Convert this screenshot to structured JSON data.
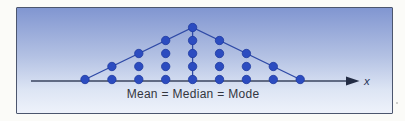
{
  "figure": {
    "caption": "Mean = Median = Mode",
    "axis_label": "x"
  },
  "chart_data": {
    "type": "scatter",
    "subtype": "dot-plot",
    "title": "",
    "x": [
      1,
      2,
      3,
      4,
      5,
      6,
      7,
      8,
      9
    ],
    "frequencies": [
      1,
      2,
      3,
      4,
      5,
      4,
      3,
      2,
      1
    ],
    "xlabel": "x",
    "ylabel": "",
    "annotation": "Mean = Median = Mode",
    "symmetric": true,
    "grid": false,
    "legend": false,
    "connectors": [
      "left-tail-to-peak",
      "peak-to-right-tail",
      "vertical-peak-to-axis"
    ]
  },
  "colors": {
    "dot_fill": "#2c4cc0",
    "dot_edge": "#1e3aa0",
    "connector_line": "#2f4aa6",
    "axis_line": "#3a445f",
    "arrow": "#232c44",
    "caption_text": "#333640",
    "axis_label_text": "#273457",
    "box_border": "#4c566e",
    "bg_top": "#8196d1",
    "bg_mid": "#b3c1e3",
    "bg_bottom": "#eef2fb",
    "page_bg": "#fbfbf8"
  }
}
